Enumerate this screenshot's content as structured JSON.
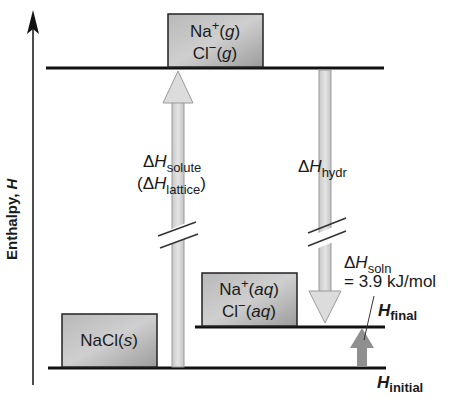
{
  "diagram": {
    "axis": {
      "label": "Enthalpy, ",
      "label_italic": "H"
    },
    "states": {
      "gas": {
        "line1_base": "Na",
        "line1_sup": "+",
        "line1_rest": "(",
        "line1_phase": "g",
        "line1_close": ")",
        "line2_base": "Cl",
        "line2_sup": "−",
        "line2_rest": "(",
        "line2_phase": "g",
        "line2_close": ")"
      },
      "aqueous": {
        "line1_base": "Na",
        "line1_sup": "+",
        "line1_rest": "(",
        "line1_phase": "aq",
        "line1_close": ")",
        "line2_base": "Cl",
        "line2_sup": "−",
        "line2_rest": "(",
        "line2_phase": "aq",
        "line2_close": ")"
      },
      "solid": {
        "base": "NaCl(",
        "phase": "s",
        "close": ")"
      }
    },
    "arrows": {
      "solute": {
        "delta": "Δ",
        "H": "H",
        "sub": "solute",
        "alt_open": "(Δ",
        "alt_H": "H",
        "alt_sub": "lattice",
        "alt_close": ")"
      },
      "hydration": {
        "delta": "Δ",
        "H": "H",
        "sub": "hydr"
      },
      "solution": {
        "delta": "Δ",
        "H": "H",
        "sub": "soln",
        "value": "= 3.9 kJ/mol"
      }
    },
    "levels": {
      "final": {
        "H": "H",
        "sub": "final"
      },
      "initial": {
        "H": "H",
        "sub": "initial"
      }
    },
    "colors": {
      "line": "#111111",
      "box_fill": "#a9a9a9",
      "arrow_fill": "#d9d9d9",
      "small_arrow_fill": "#8f8f8f"
    }
  }
}
